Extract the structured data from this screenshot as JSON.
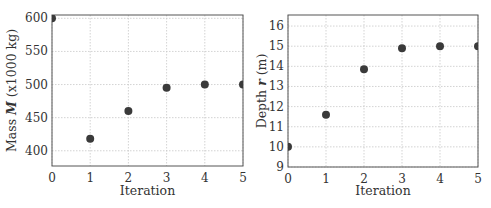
{
  "chart_data": [
    {
      "type": "scatter",
      "title": "",
      "xlabel": "Iteration",
      "ylabel": "Mass M (x1000 kg)",
      "ylabel_parts": {
        "pre": "Mass ",
        "sym": "M",
        "post": " (x1000 kg)"
      },
      "x": [
        0,
        1,
        2,
        3,
        4,
        5
      ],
      "values": [
        600,
        418,
        460,
        495,
        500,
        500
      ],
      "xlim": [
        0,
        5
      ],
      "ylim": [
        377,
        605
      ],
      "xticks": [
        "0",
        "1",
        "2",
        "3",
        "4",
        "5"
      ],
      "yticks": [
        "400",
        "450",
        "500",
        "550",
        "600"
      ],
      "grid": true,
      "legend": null
    },
    {
      "type": "scatter",
      "title": "",
      "xlabel": "Iteration",
      "ylabel": "Depth r (m)",
      "ylabel_parts": {
        "pre": "Depth ",
        "sym": "r",
        "post": " (m)"
      },
      "x": [
        0,
        1,
        2,
        3,
        4,
        5
      ],
      "values": [
        10.0,
        11.6,
        13.85,
        14.9,
        15.0,
        15.0
      ],
      "xlim": [
        0,
        5
      ],
      "ylim": [
        9,
        16.55
      ],
      "xticks": [
        "0",
        "1",
        "2",
        "3",
        "4",
        "5"
      ],
      "yticks": [
        "9",
        "10",
        "11",
        "12",
        "13",
        "14",
        "15",
        "16"
      ],
      "grid": true,
      "legend": null
    }
  ],
  "colors": {
    "marker": "#3a3a3a",
    "frame": "#555555",
    "grid": "#c8c8c8"
  }
}
